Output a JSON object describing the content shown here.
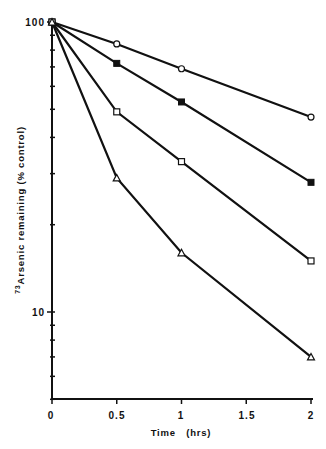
{
  "chart_data": {
    "type": "line",
    "title": "",
    "xlabel": "Time   (hrs)",
    "ylabel": "Arsenic remaining (% control)",
    "ylabel_superscript": "73",
    "yscale": "log",
    "xlim": [
      0,
      2
    ],
    "ylim": [
      5,
      100
    ],
    "x": [
      0,
      0.5,
      1,
      2
    ],
    "xticks": [
      "0",
      "0.5",
      "1",
      "1.5",
      "2"
    ],
    "yticks": [
      "10",
      "100"
    ],
    "grid": false,
    "legend": null,
    "series": [
      {
        "name": "open circle",
        "marker": "circle-open",
        "values": [
          100,
          84,
          69,
          47
        ]
      },
      {
        "name": "filled square",
        "marker": "square-filled",
        "values": [
          100,
          72,
          53,
          28
        ]
      },
      {
        "name": "open square",
        "marker": "square-open",
        "values": [
          100,
          49,
          33,
          15
        ]
      },
      {
        "name": "open triangle",
        "marker": "triangle-open",
        "values": [
          100,
          29,
          16,
          7
        ]
      }
    ]
  },
  "axes": {
    "x_title": "Time   (hrs)",
    "y_title_sup": "73",
    "y_title": "Arsenic remaining (% control)",
    "x_tick_labels": [
      "0",
      "0.5",
      "1",
      "1.5",
      "2"
    ],
    "y_tick_labels": [
      "10",
      "100"
    ]
  },
  "colors": {
    "line": "#111111",
    "background": "#ffffff"
  }
}
